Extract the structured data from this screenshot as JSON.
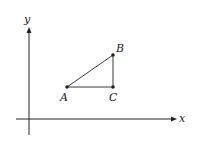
{
  "diagram": {
    "axes": {
      "x_label": "x",
      "y_label": "y"
    },
    "points": [
      {
        "id": "A",
        "label": "A"
      },
      {
        "id": "B",
        "label": "B"
      },
      {
        "id": "C",
        "label": "C"
      }
    ],
    "shape": "right triangle ABC with right angle at C",
    "colors": {
      "stroke": "#222222",
      "background": "#ffffff"
    }
  }
}
